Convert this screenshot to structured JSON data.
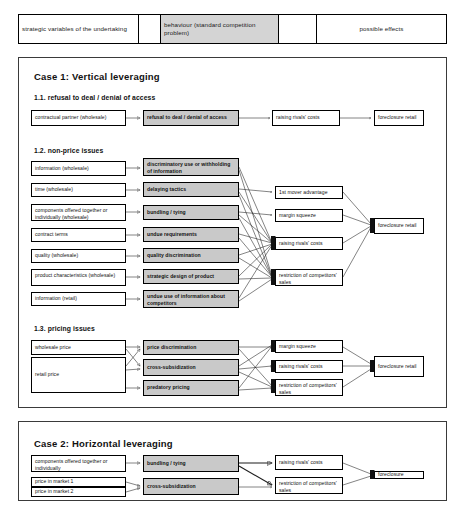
{
  "legend": {
    "cells": [
      {
        "label": "strategic variables of the undertaking",
        "shaded": false
      },
      {
        "label": "",
        "shaded": false
      },
      {
        "label": "behaviour (standard competition problem)",
        "shaded": true
      },
      {
        "label": "",
        "shaded": false
      },
      {
        "label": "possible effects",
        "shaded": false
      }
    ]
  },
  "case1": {
    "title": "Case 1: Vertical leveraging",
    "sections": {
      "s11": {
        "title": "1.1. refusal to deal / denial of access",
        "variables": [
          "contractual partner (wholesale)"
        ],
        "behaviours": [
          "refusal to deal / denial of access"
        ],
        "effects": [
          "raising rivals' costs"
        ],
        "outcomes": [
          "foreclosure retail"
        ]
      },
      "s12": {
        "title": "1.2. non-price issues",
        "variables": [
          "information (wholesale)",
          "time (wholesale)",
          "components offered together or individually (wholesale)",
          "contract terms",
          "quality (wholesale)",
          "product characteristics (wholesale)",
          "information (retail)"
        ],
        "behaviours": [
          "discriminatory use or withholding of information",
          "delaying tactics",
          "bundling / tying",
          "undue requirements",
          "quality discrimination",
          "strategic design of product",
          "undue use of information about competitors"
        ],
        "effects": [
          "1st mover advantage",
          "margin squeeze",
          "raising rivals' costs",
          "restriction of competitors' sales"
        ],
        "outcomes": [
          "foreclosure retail"
        ]
      },
      "s13": {
        "title": "1.3. pricing issues",
        "variables": [
          "wholesale price",
          "retail price"
        ],
        "behaviours": [
          "price discrimination",
          "cross-subsidization",
          "predatory pricing"
        ],
        "effects": [
          "margin squeeze",
          "raising rivals' costs",
          "restriction of competitors' sales"
        ],
        "outcomes": [
          "foreclosure retail"
        ]
      }
    }
  },
  "case2": {
    "title": "Case 2: Horizontal leveraging",
    "variables": [
      "components offered together or individually",
      "price in market 1",
      "price in market 2"
    ],
    "behaviours": [
      "bundling / tying",
      "cross-subsidization"
    ],
    "effects": [
      "raising rivals' costs",
      "restriction of competitors' sales"
    ],
    "outcomes": [
      "foreclosure"
    ]
  },
  "colors": {
    "behaviour_fill": "#c9c9c9",
    "line": "#1d1d1d",
    "border": "#000000"
  }
}
